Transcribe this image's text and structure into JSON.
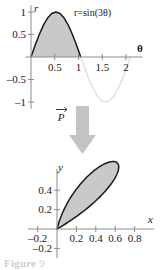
{
  "figure": {
    "name": "polar-petal-transformation-figure",
    "caption_label": "Figure",
    "caption_body": "9"
  },
  "colors": {
    "fill": "#c9c9c9",
    "outline": "#1a1a1a",
    "axis": "#8c8c8c",
    "faint_curve": "#e2e2e2",
    "arrow": "#c4c4c4",
    "text": "#1a1a1a"
  },
  "arrow": {
    "label": "P",
    "vector_mark": "→",
    "icon": "down-arrow-icon"
  },
  "chart_data": [
    {
      "id": "top",
      "type": "line",
      "title": "",
      "annotation": "r=sin(3θ)",
      "xlabel": "θ",
      "ylabel": "r",
      "xlim": [
        -0.12,
        2.35
      ],
      "ylim": [
        -1.15,
        1.15
      ],
      "grid": false,
      "xticks": [
        0.5,
        1,
        1.5,
        2
      ],
      "xticklabels": [
        "0.5",
        "1",
        "1.5",
        "2"
      ],
      "yticks": [
        1,
        0.5,
        -0.5,
        -1
      ],
      "yticklabels": [
        "1",
        "0.5",
        "–0.5",
        "–1"
      ],
      "shaded_interval": [
        0,
        1.0472
      ],
      "series": [
        {
          "name": "r=sin(3θ) shaded hump",
          "style": "solid-outline-filled",
          "x": [
            0,
            0.0873,
            0.1745,
            0.2618,
            0.3491,
            0.4363,
            0.5236,
            0.6109,
            0.6981,
            0.7854,
            0.8727,
            0.9599,
            1.0472
          ],
          "y": [
            0,
            0.2588,
            0.5,
            0.7071,
            0.866,
            0.9659,
            1,
            0.9659,
            0.866,
            0.7071,
            0.5,
            0.2588,
            0
          ]
        },
        {
          "name": "r=sin(3θ) negative lobe",
          "style": "faint-solid",
          "x": [
            1.0472,
            1.1345,
            1.2217,
            1.309,
            1.3963,
            1.4835,
            1.5708,
            1.6581,
            1.7453,
            1.8326,
            1.9199,
            2.0071,
            2.0944
          ],
          "y": [
            0,
            -0.2588,
            -0.5,
            -0.7071,
            -0.866,
            -0.9659,
            -1,
            -0.9659,
            -0.866,
            -0.7071,
            -0.5,
            -0.2588,
            0
          ]
        }
      ]
    },
    {
      "id": "bottom",
      "type": "line",
      "title": "",
      "annotation": "",
      "xlabel": "x",
      "ylabel": "y",
      "xlim": [
        -0.3,
        1.0
      ],
      "ylim": [
        -0.3,
        0.62
      ],
      "grid": false,
      "xticks": [
        -0.2,
        0.2,
        0.4,
        0.6,
        0.8
      ],
      "xticklabels": [
        "–0.2",
        "0.2",
        "0.4",
        "0.6",
        "0.8"
      ],
      "yticks": [
        0.4,
        0.2,
        -0.2
      ],
      "yticklabels": [
        "0.4",
        "0.2",
        "–0.2"
      ],
      "series": [
        {
          "name": "polar petal r=sin(3θ) rotated lobe",
          "style": "solid-outline-filled",
          "note": "closed petal from origin sweeping to upper-right, max y near 0.5, x extent to 0.87",
          "x": [
            0,
            0.0337,
            0.1208,
            0.2382,
            0.3617,
            0.4714,
            0.5567,
            0.6181,
            0.6547,
            0.665,
            0.6459,
            0.5941,
            0.5106,
            0.4045,
            0.2946,
            0.2013,
            0.1296,
            0.0751,
            0.0332,
            0
          ],
          "y": [
            0,
            0.1294,
            0.25,
            0.3314,
            0.3617,
            0.3536,
            0.3214,
            0.2745,
            0.2184,
            0.1545,
            0.0841,
            0.0,
            0.0,
            0.0,
            0.0,
            0.0,
            0.0,
            0.0,
            0.0,
            0
          ]
        }
      ]
    }
  ]
}
